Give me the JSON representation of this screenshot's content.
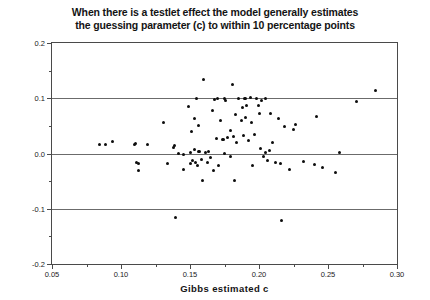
{
  "chart_data": {
    "type": "scatter",
    "title": "When there is a testlet effect the model generally estimates the guessing parameter (c) to within 10 percentage points",
    "title_lines": [
      "When there is a testlet effect the model generally estimates",
      "the guessing parameter (c) to within 10 percentage points"
    ],
    "xlabel": "Gibbs estimated c",
    "ylabel": "Estimated c MINUS True c",
    "xlim": [
      0.05,
      0.3
    ],
    "ylim": [
      -0.2,
      0.2
    ],
    "xticks": [
      0.05,
      0.1,
      0.15,
      0.2,
      0.25,
      0.3
    ],
    "xtick_labels": [
      "0.05",
      "0.10",
      "0.15",
      "0.20",
      "0.25",
      "0.30"
    ],
    "xticks_minor": [
      0.075,
      0.125,
      0.175,
      0.225,
      0.275
    ],
    "yticks": [
      0.2,
      0.1,
      0.0,
      -0.1,
      -0.2
    ],
    "ytick_labels": [
      "0.2",
      "0.1",
      "0.0",
      "-0.1",
      "-0.2"
    ],
    "yticks_minor": [
      0.15,
      0.05,
      -0.05,
      -0.15
    ],
    "grid": false,
    "legend": null,
    "marker": "filled-circle",
    "marker_color": "#0d0d0d",
    "reference_lines": [
      {
        "y": 0.1,
        "color": "#6b6b6b",
        "style": "solid"
      },
      {
        "y": 0.0,
        "color": "#6b6b6b",
        "style": "solid"
      },
      {
        "y": -0.1,
        "color": "#6b6b6b",
        "style": "solid"
      }
    ],
    "n_points": 97,
    "points": [
      [
        0.0845,
        0.0155
      ],
      [
        0.0885,
        0.0165
      ],
      [
        0.0935,
        0.0215
      ],
      [
        0.1095,
        0.0155
      ],
      [
        0.1105,
        0.0185
      ],
      [
        0.1115,
        -0.0165
      ],
      [
        0.1125,
        -0.0175
      ],
      [
        0.113,
        -0.0305
      ],
      [
        0.1195,
        0.0155
      ],
      [
        0.1305,
        0.056
      ],
      [
        0.134,
        -0.0185
      ],
      [
        0.138,
        0.0105
      ],
      [
        0.1395,
        -0.115
      ],
      [
        0.142,
        0.0005
      ],
      [
        0.145,
        -0.001
      ],
      [
        0.1455,
        -0.0295
      ],
      [
        0.149,
        0.085
      ],
      [
        0.15,
        -0.018
      ],
      [
        0.1505,
        0.002
      ],
      [
        0.151,
        0.039
      ],
      [
        0.152,
        -0.013
      ],
      [
        0.153,
        0.063
      ],
      [
        0.1535,
        0.007
      ],
      [
        0.154,
        -0.0165
      ],
      [
        0.155,
        0.099
      ],
      [
        0.1555,
        -0.0225
      ],
      [
        0.156,
        0.004
      ],
      [
        0.1565,
        0.05
      ],
      [
        0.157,
        0.0035
      ],
      [
        0.158,
        -0.0105
      ],
      [
        0.159,
        -0.049
      ],
      [
        0.16,
        0.134
      ],
      [
        0.1615,
        0.001
      ],
      [
        0.1625,
        -0.017
      ],
      [
        0.1635,
        0.003
      ],
      [
        0.165,
        -0.0065
      ],
      [
        0.166,
        0.0785
      ],
      [
        0.167,
        -0.03
      ],
      [
        0.168,
        0.098
      ],
      [
        0.169,
        0.027
      ],
      [
        0.17,
        0.099
      ],
      [
        0.1705,
        -0.0215
      ],
      [
        0.172,
        0.06
      ],
      [
        0.1735,
        0.0255
      ],
      [
        0.1745,
        0.0245
      ],
      [
        0.175,
        0.0
      ],
      [
        0.176,
        0.0965
      ],
      [
        0.177,
        0.029
      ],
      [
        0.179,
        0.0425
      ],
      [
        0.1795,
        -0.006
      ],
      [
        0.1805,
        0.124
      ],
      [
        0.1815,
        0.031
      ],
      [
        0.182,
        -0.049
      ],
      [
        0.183,
        0.07
      ],
      [
        0.184,
        0.02
      ],
      [
        0.1855,
        0.099
      ],
      [
        0.187,
        0.0595
      ],
      [
        0.188,
        0.0835
      ],
      [
        0.1885,
        0.032
      ],
      [
        0.1895,
        0.099
      ],
      [
        0.19,
        0.0645
      ],
      [
        0.191,
        0.087
      ],
      [
        0.1925,
        0.0235
      ],
      [
        0.1935,
        0.1015
      ],
      [
        0.1945,
        0.0555
      ],
      [
        0.195,
        -0.0225
      ],
      [
        0.1965,
        0.035
      ],
      [
        0.1985,
        0.099
      ],
      [
        0.1995,
        0.0875
      ],
      [
        0.2,
        0.0715
      ],
      [
        0.201,
        0.0095
      ],
      [
        0.202,
        0.0955
      ],
      [
        0.2035,
        -0.0055
      ],
      [
        0.2045,
        0.0025
      ],
      [
        0.206,
        -0.0135
      ],
      [
        0.2075,
        0.006
      ],
      [
        0.2085,
        0.072
      ],
      [
        0.21,
        0.02
      ],
      [
        0.212,
        -0.0165
      ],
      [
        0.214,
        0.063
      ],
      [
        0.2155,
        -0.0185
      ],
      [
        0.2165,
        -0.122
      ],
      [
        0.2185,
        0.048
      ],
      [
        0.222,
        -0.0285
      ],
      [
        0.225,
        0.043
      ],
      [
        0.2265,
        0.053
      ],
      [
        0.232,
        -0.0145
      ],
      [
        0.2405,
        -0.0195
      ],
      [
        0.2415,
        0.0665
      ],
      [
        0.246,
        -0.0245
      ],
      [
        0.2555,
        -0.035
      ],
      [
        0.258,
        0.001
      ],
      [
        0.2705,
        0.094
      ],
      [
        0.2845,
        0.1135
      ],
      [
        0.1385,
        0.014
      ],
      [
        0.175,
        0.099
      ],
      [
        0.1905,
        0.099
      ],
      [
        0.2045,
        0.099
      ]
    ]
  }
}
